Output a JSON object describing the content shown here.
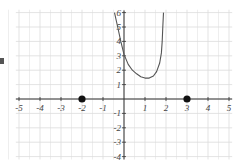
{
  "chart_data": {
    "type": "line",
    "title": "",
    "xlabel": "",
    "ylabel": "",
    "xlim": [
      -5,
      5
    ],
    "ylim": [
      -4,
      6
    ],
    "grid": true,
    "x_ticks": [
      -5,
      -4,
      -3,
      -2,
      -1,
      1,
      2,
      3,
      4,
      5
    ],
    "y_ticks": [
      -4,
      -3,
      -2,
      -1,
      1,
      2,
      3,
      4,
      5,
      6
    ],
    "x_tick_labels": [
      "-5",
      "-4",
      "-3",
      "-2",
      "-1",
      "1",
      "2",
      "3",
      "4",
      "5"
    ],
    "y_tick_labels": [
      "-4",
      "-3",
      "-2",
      "-1",
      "1",
      "2",
      "3",
      "4",
      "5",
      "6"
    ],
    "series": [
      {
        "name": "curve",
        "x": [
          -0.45,
          -0.3,
          -0.15,
          0,
          0.2,
          0.4,
          0.6,
          0.8,
          1.0,
          1.2,
          1.4,
          1.55,
          1.7,
          1.78,
          1.82,
          1.85,
          1.88
        ],
        "y": [
          6,
          5,
          4,
          3.1,
          2.4,
          2.0,
          1.75,
          1.55,
          1.45,
          1.45,
          1.6,
          1.9,
          2.5,
          3.2,
          4.0,
          5.0,
          6.0
        ]
      }
    ],
    "points": [
      {
        "x": -2,
        "y": 0,
        "style": "filled-dot"
      },
      {
        "x": 3,
        "y": 0,
        "style": "filled-dot"
      }
    ]
  },
  "colors": {
    "grid": "#dcdcdc",
    "axis": "#333333",
    "curve": "#555555",
    "point": "#111111"
  }
}
